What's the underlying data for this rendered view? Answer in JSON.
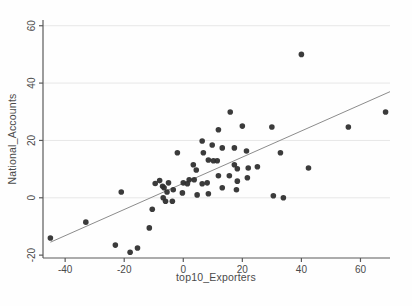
{
  "chart_data": {
    "type": "scatter",
    "title": "",
    "xlabel": "top10_Exporters",
    "ylabel": "National_Accounts",
    "xlim": [
      -47.5,
      70
    ],
    "ylim": [
      -21,
      62
    ],
    "xticks": [
      -40,
      -20,
      0,
      20,
      40,
      60
    ],
    "yticks": [
      -20,
      0,
      20,
      40,
      60
    ],
    "grid": "faint horizontal gridlines at y ticks",
    "legend": "none",
    "points": [
      [
        -45,
        -14
      ],
      [
        -33,
        -8.5
      ],
      [
        -23,
        -16.5
      ],
      [
        -21,
        2
      ],
      [
        -18,
        -19
      ],
      [
        -15.5,
        -17.5
      ],
      [
        -11.5,
        -10.5
      ],
      [
        -10.5,
        -4
      ],
      [
        -9.5,
        5
      ],
      [
        -8,
        6
      ],
      [
        -7,
        4
      ],
      [
        -6.5,
        3.5
      ],
      [
        -6.8,
        0
      ],
      [
        -6,
        -1.2
      ],
      [
        -5,
        5.2
      ],
      [
        -5.5,
        2
      ],
      [
        -3.7,
        -1.2
      ],
      [
        -3.4,
        2.8
      ],
      [
        -2,
        15.7
      ],
      [
        -0.3,
        1.7
      ],
      [
        0,
        5.2
      ],
      [
        1.4,
        4.9
      ],
      [
        2,
        6.3
      ],
      [
        3.4,
        11.5
      ],
      [
        3.7,
        6.3
      ],
      [
        4.4,
        9.7
      ],
      [
        4.7,
        1
      ],
      [
        6.4,
        19.8
      ],
      [
        6.8,
        15.7
      ],
      [
        6.4,
        4.9
      ],
      [
        8.1,
        5.2
      ],
      [
        8.5,
        13.2
      ],
      [
        8.5,
        1.4
      ],
      [
        9.8,
        18.4
      ],
      [
        10.2,
        12.9
      ],
      [
        11.9,
        23.7
      ],
      [
        11.5,
        12.9
      ],
      [
        11.9,
        7.7
      ],
      [
        13.2,
        17.4
      ],
      [
        13.2,
        3.5
      ],
      [
        15.6,
        7.7
      ],
      [
        15.9,
        29.9
      ],
      [
        17.3,
        17.4
      ],
      [
        17.3,
        11.5
      ],
      [
        18.3,
        10.1
      ],
      [
        18,
        2.8
      ],
      [
        18.3,
        5.8
      ],
      [
        20,
        25
      ],
      [
        21.4,
        16.3
      ],
      [
        22,
        10.4
      ],
      [
        21.7,
        7
      ],
      [
        25.1,
        10.8
      ],
      [
        30,
        24.7
      ],
      [
        32.9,
        15.7
      ],
      [
        30.5,
        0.7
      ],
      [
        33.9,
        0
      ],
      [
        40,
        50
      ],
      [
        42.4,
        10.4
      ],
      [
        55.9,
        24.7
      ],
      [
        68.5,
        29.9
      ]
    ],
    "trendline": {
      "x1": -45,
      "y1": -15.5,
      "x2": 70,
      "y2": 37
    },
    "colors": {
      "point": "#2f2f2f",
      "trend": "#8c8c8c",
      "axis": "#5a5a5a",
      "grid": "#e7e7e7",
      "tick_label": "#4a4a4a",
      "background": "#fefefe"
    }
  }
}
